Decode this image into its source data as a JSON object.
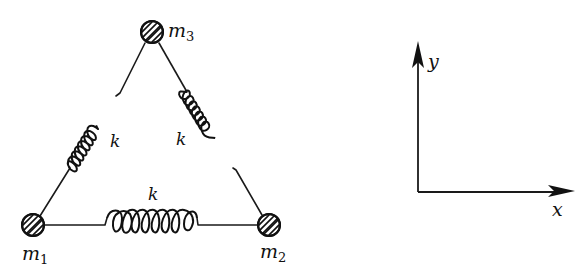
{
  "diagram": {
    "type": "spring-mass system",
    "masses": [
      {
        "id": "m1",
        "label": "m",
        "subscript": "1",
        "cx": 33,
        "cy": 225
      },
      {
        "id": "m2",
        "label": "m",
        "subscript": "2",
        "cx": 269,
        "cy": 225
      },
      {
        "id": "m3",
        "label": "m",
        "subscript": "3",
        "cx": 152,
        "cy": 32
      }
    ],
    "springs": [
      {
        "id": "spring-m1-m3",
        "label": "k",
        "connects": [
          "m1",
          "m3"
        ]
      },
      {
        "id": "spring-m3-m2",
        "label": "k",
        "connects": [
          "m3",
          "m2"
        ]
      },
      {
        "id": "spring-m1-m2",
        "label": "k",
        "connects": [
          "m1",
          "m2"
        ]
      }
    ],
    "axes": {
      "x_label": "x",
      "y_label": "y"
    },
    "colors": {
      "ink": "#111111",
      "background": "#ffffff"
    }
  }
}
